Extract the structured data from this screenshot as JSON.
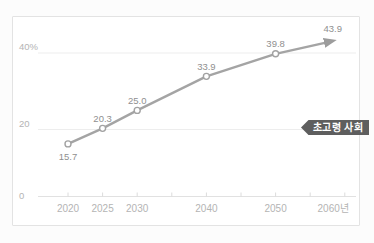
{
  "chart_data": {
    "type": "line",
    "title": "",
    "xlabel": "",
    "ylabel": "%",
    "x": [
      2020,
      2025,
      2030,
      2040,
      2050,
      2060
    ],
    "values": [
      15.7,
      20.3,
      25.0,
      33.9,
      39.8,
      43.9
    ],
    "point_labels": [
      "15.7",
      "20.3",
      "25.0",
      "33.9",
      "39.8",
      "43.9"
    ],
    "point_label_positions": [
      "below",
      "above",
      "above",
      "above",
      "above",
      "above"
    ],
    "x_tick_labels": [
      {
        "year": 2020,
        "label": "2020"
      },
      {
        "year": 2025,
        "label": "2025"
      },
      {
        "year": 2030,
        "label": "2030"
      },
      {
        "year": 2040,
        "label": "2040"
      },
      {
        "year": 2050,
        "label": "2050"
      },
      {
        "year": 2060,
        "label": "2060년"
      }
    ],
    "x_minor_tick_years": [
      2020,
      2025,
      2030,
      2035,
      2040,
      2045,
      2050,
      2055,
      2060
    ],
    "y_ticks": [
      {
        "value": 40,
        "label": "40%"
      },
      {
        "value": 20,
        "label": "20"
      },
      {
        "value": 0,
        "label": "0"
      }
    ],
    "xlim": [
      2016,
      2062
    ],
    "ylim": [
      0,
      47
    ],
    "grid": "horizontal-light",
    "legend": "none",
    "line_end": "arrowhead",
    "markers": "open-circle",
    "annotation": "초고령 사회"
  },
  "badge": {
    "label": "초고령 사회"
  },
  "colors": {
    "line": "#a4a4a4",
    "marker_fill": "#ffffff",
    "marker_stroke": "#a2a2a2",
    "arrow": "#9c9c9c",
    "grid": "#ededed",
    "axis": "#e1e1e1",
    "tick": "#dcdcdc",
    "axis_text": "#b4b4b4",
    "value_text": "#8f8f8f",
    "badge_bg": "#5e5e5e",
    "badge_text": "#ffffff",
    "frame_border": "#e3e3e3",
    "background": "#ffffff"
  }
}
